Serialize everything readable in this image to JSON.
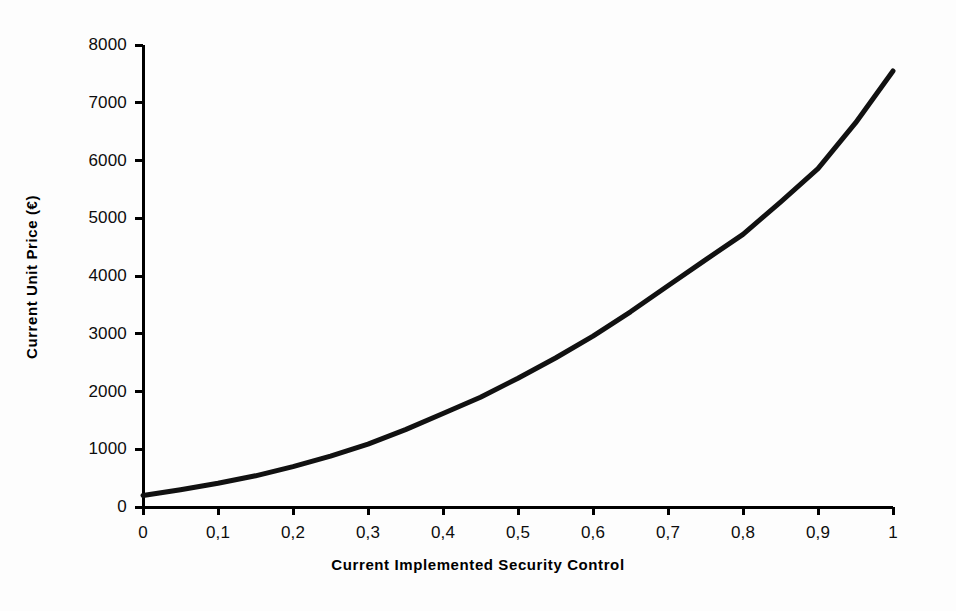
{
  "chart_data": {
    "type": "line",
    "title": "",
    "xlabel": "Current Implemented Security Control",
    "ylabel": "Current Unit Price (€)",
    "xlim": [
      0,
      1
    ],
    "ylim": [
      0,
      8000
    ],
    "grid": false,
    "legend": false,
    "x_tick_labels": [
      "0",
      "0,1",
      "0,2",
      "0,3",
      "0,4",
      "0,5",
      "0,6",
      "0,7",
      "0,8",
      "0,9",
      "1"
    ],
    "y_tick_labels": [
      "0",
      "1000",
      "2000",
      "3000",
      "4000",
      "5000",
      "6000",
      "7000",
      "8000"
    ],
    "x_ticks": [
      0,
      0.1,
      0.2,
      0.3,
      0.4,
      0.5,
      0.6,
      0.7,
      0.8,
      0.9,
      1
    ],
    "y_ticks": [
      0,
      1000,
      2000,
      3000,
      4000,
      5000,
      6000,
      7000,
      8000
    ],
    "series": [
      {
        "name": "Current Unit Price",
        "color": "#111111",
        "line_width": 5,
        "x": [
          0,
          0.05,
          0.1,
          0.15,
          0.2,
          0.25,
          0.3,
          0.35,
          0.4,
          0.45,
          0.5,
          0.55,
          0.6,
          0.65,
          0.7,
          0.75,
          0.8,
          0.85,
          0.9,
          0.95,
          1
        ],
        "values": [
          200,
          300,
          410,
          540,
          700,
          880,
          1090,
          1340,
          1620,
          1900,
          2230,
          2580,
          2960,
          3380,
          3830,
          4280,
          4720,
          5280,
          5860,
          6650,
          7550
        ]
      }
    ],
    "axis": {
      "color": "#000000",
      "line_width": 3,
      "tick_length": 8,
      "spine_left": true,
      "spine_bottom": true,
      "spine_top": false,
      "spine_right": false
    }
  },
  "figure": {
    "background": "#fdfdfd",
    "plot_left_px": 143,
    "plot_right_px": 893,
    "plot_top_px": 45,
    "plot_bottom_px": 507
  }
}
